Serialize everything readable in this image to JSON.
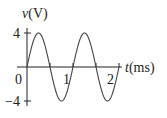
{
  "chart_data": {
    "type": "line",
    "title": "",
    "xlabel_var": "t",
    "xlabel_unit": "(ms)",
    "ylabel_var": "v",
    "ylabel_unit": "(V)",
    "x_ticks": [
      {
        "value": 0,
        "label": "0"
      },
      {
        "value": 1,
        "label": "1"
      },
      {
        "value": 2,
        "label": "2"
      }
    ],
    "y_ticks": [
      {
        "value": 4,
        "label": "4"
      },
      {
        "value": -4,
        "label": "−4"
      }
    ],
    "xlim": [
      0,
      2
    ],
    "ylim": [
      -4,
      4
    ],
    "grid": false,
    "series": [
      {
        "name": "v(t) = 4 sin(2π·t/1ms)",
        "amplitude": 4,
        "period_ms": 1,
        "x": [
          0,
          0.125,
          0.25,
          0.375,
          0.5,
          0.625,
          0.75,
          0.875,
          1,
          1.125,
          1.25,
          1.375,
          1.5,
          1.625,
          1.75,
          1.875,
          2
        ],
        "values": [
          0,
          2.83,
          4,
          2.83,
          0,
          -2.83,
          -4,
          -2.83,
          0,
          2.83,
          4,
          2.83,
          0,
          -2.83,
          -4,
          -2.83,
          0
        ]
      }
    ]
  }
}
